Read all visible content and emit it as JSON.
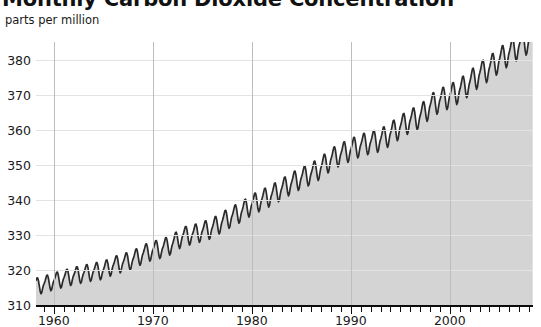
{
  "chart_data": {
    "type": "line",
    "title": "Monthly Carbon Dioxide Concentration",
    "subtitle": "",
    "ylabel": "parts per million",
    "xlabel": "",
    "ylim": [
      310,
      385
    ],
    "xlim": [
      1958.2,
      2008.4
    ],
    "yticks": [
      310,
      320,
      330,
      340,
      350,
      360,
      370,
      380
    ],
    "xticks": [
      1960,
      1970,
      1980,
      1990,
      2000
    ],
    "xtick_minor_step": 1,
    "grid": "horizontal-and-decade-vertical",
    "legend": "none",
    "fill": true,
    "series_name": "Monthly mean CO2",
    "annual_means": [
      {
        "year": 1958,
        "value": 315.3
      },
      {
        "year": 1959,
        "value": 315.98
      },
      {
        "year": 1960,
        "value": 316.91
      },
      {
        "year": 1961,
        "value": 317.64
      },
      {
        "year": 1962,
        "value": 318.45
      },
      {
        "year": 1963,
        "value": 318.99
      },
      {
        "year": 1964,
        "value": 319.62
      },
      {
        "year": 1965,
        "value": 320.04
      },
      {
        "year": 1966,
        "value": 321.37
      },
      {
        "year": 1967,
        "value": 322.18
      },
      {
        "year": 1968,
        "value": 323.05
      },
      {
        "year": 1969,
        "value": 324.62
      },
      {
        "year": 1970,
        "value": 325.68
      },
      {
        "year": 1971,
        "value": 326.32
      },
      {
        "year": 1972,
        "value": 327.46
      },
      {
        "year": 1973,
        "value": 329.68
      },
      {
        "year": 1974,
        "value": 330.19
      },
      {
        "year": 1975,
        "value": 331.12
      },
      {
        "year": 1976,
        "value": 332.03
      },
      {
        "year": 1977,
        "value": 333.84
      },
      {
        "year": 1978,
        "value": 335.41
      },
      {
        "year": 1979,
        "value": 336.84
      },
      {
        "year": 1980,
        "value": 338.76
      },
      {
        "year": 1981,
        "value": 340.12
      },
      {
        "year": 1982,
        "value": 341.48
      },
      {
        "year": 1983,
        "value": 343.15
      },
      {
        "year": 1984,
        "value": 344.87
      },
      {
        "year": 1985,
        "value": 346.35
      },
      {
        "year": 1986,
        "value": 347.61
      },
      {
        "year": 1987,
        "value": 349.31
      },
      {
        "year": 1988,
        "value": 351.69
      },
      {
        "year": 1989,
        "value": 353.2
      },
      {
        "year": 1990,
        "value": 354.45
      },
      {
        "year": 1991,
        "value": 355.7
      },
      {
        "year": 1992,
        "value": 356.54
      },
      {
        "year": 1993,
        "value": 357.21
      },
      {
        "year": 1994,
        "value": 358.96
      },
      {
        "year": 1995,
        "value": 360.97
      },
      {
        "year": 1996,
        "value": 362.74
      },
      {
        "year": 1997,
        "value": 363.88
      },
      {
        "year": 1998,
        "value": 366.84
      },
      {
        "year": 1999,
        "value": 368.54
      },
      {
        "year": 2000,
        "value": 369.71
      },
      {
        "year": 2001,
        "value": 371.32
      },
      {
        "year": 2002,
        "value": 373.45
      },
      {
        "year": 2003,
        "value": 375.98
      },
      {
        "year": 2004,
        "value": 377.7
      },
      {
        "year": 2005,
        "value": 379.98
      },
      {
        "year": 2006,
        "value": 382.09
      },
      {
        "year": 2007,
        "value": 384.02
      },
      {
        "year": 2008,
        "value": 385.6
      }
    ],
    "seasonal_cycle_ppm": [
      -0.05,
      0.62,
      1.42,
      2.55,
      3.0,
      2.27,
      0.6,
      -1.47,
      -3.1,
      -3.3,
      -2.05,
      -0.6
    ],
    "seasonal_months": [
      "Jan",
      "Feb",
      "Mar",
      "Apr",
      "May",
      "Jun",
      "Jul",
      "Aug",
      "Sep",
      "Oct",
      "Nov",
      "Dec"
    ]
  },
  "style": {
    "line_color": "#2b2b2b",
    "fill_color": "#d4d4d4",
    "grid_color": "#e3e3e3",
    "vgrid_color": "#bdbdbd",
    "axis_color": "#0d0d0d",
    "text_color": "#1a1a1a",
    "background": "#ffffff"
  },
  "watermark_ghost": [
    "1960",
    "1970",
    "1980",
    "1990",
    "2000"
  ]
}
